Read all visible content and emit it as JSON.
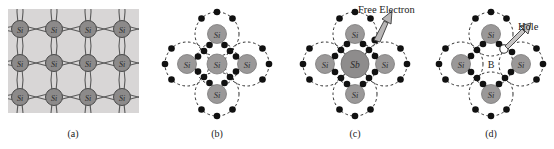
{
  "figure": {
    "background_color": "#ffffff",
    "panels": [
      {
        "id": "a",
        "caption": "(a)",
        "type": "silicon-lattice",
        "description": "Intrinsic silicon crystal lattice with covalent bonds",
        "atom_label": "Si",
        "rows": 3,
        "cols": 4,
        "lattice_fill": "#d8d6d6",
        "atom_fill": "#8c8a8a",
        "bond_color": "#555555"
      },
      {
        "id": "b",
        "caption": "(b)",
        "type": "covalent-bond-diagram",
        "description": "Silicon atom covalently bonded to four neighbouring silicon atoms",
        "center_atom_label": "Si",
        "neighbor_atom_labels": [
          "Si",
          "Si",
          "Si",
          "Si"
        ],
        "center_atom_fill": "#9a9898",
        "neighbor_atom_fill": "#9a9898",
        "orbit_style": "dashed",
        "electron_color": "#111111",
        "annotations": []
      },
      {
        "id": "c",
        "caption": "(c)",
        "type": "n-type-doping-diagram",
        "description": "Antimony donor atom in silicon producing a free electron",
        "center_atom_label": "Sb",
        "neighbor_atom_labels": [
          "Si",
          "Si",
          "Si",
          "Si"
        ],
        "center_atom_fill": "#8e8c8c",
        "neighbor_atom_fill": "#9a9898",
        "orbit_style": "dashed",
        "electron_color": "#111111",
        "annotations": [
          {
            "name": "free-electron",
            "text": "Free Electron"
          }
        ]
      },
      {
        "id": "d",
        "caption": "(d)",
        "type": "p-type-doping-diagram",
        "description": "Boron acceptor atom in silicon producing a hole",
        "center_atom_label": "B",
        "neighbor_atom_labels": [
          "Si",
          "Si",
          "Si",
          "Si"
        ],
        "center_atom_fill": "#ffffff",
        "neighbor_atom_fill": "#9a9898",
        "orbit_style": "dashed",
        "electron_color": "#111111",
        "hole_fill": "#ffffff",
        "annotations": [
          {
            "name": "hole",
            "text": "Hole"
          }
        ]
      }
    ]
  },
  "labels": {
    "si": "Si",
    "sb": "Sb",
    "b": "B",
    "free_electron": "Free Electron",
    "hole": "Hole",
    "caption_a": "(a)",
    "caption_b": "(b)",
    "caption_c": "(c)",
    "caption_d": "(d)"
  }
}
